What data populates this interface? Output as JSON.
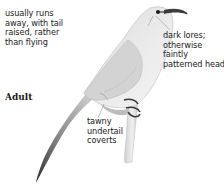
{
  "figure": {
    "age_label": "Adult",
    "annotations": {
      "behavior": {
        "lines": [
          "usually runs",
          "away, with tail",
          "raised, rather",
          "than flying"
        ]
      },
      "head": {
        "lines": [
          "dark lores;",
          "otherwise",
          "faintly",
          "patterned head"
        ]
      },
      "undertail": {
        "lines": [
          "tawny",
          "undertail",
          "coverts"
        ]
      }
    },
    "colors": {
      "background": "#ffffff",
      "text": "#222222",
      "body_light": "#e9e9e9",
      "body_shade": "#c9c9c9",
      "tail_dark": "#3a3a3a",
      "leader_line": "#8a8a8a"
    }
  }
}
